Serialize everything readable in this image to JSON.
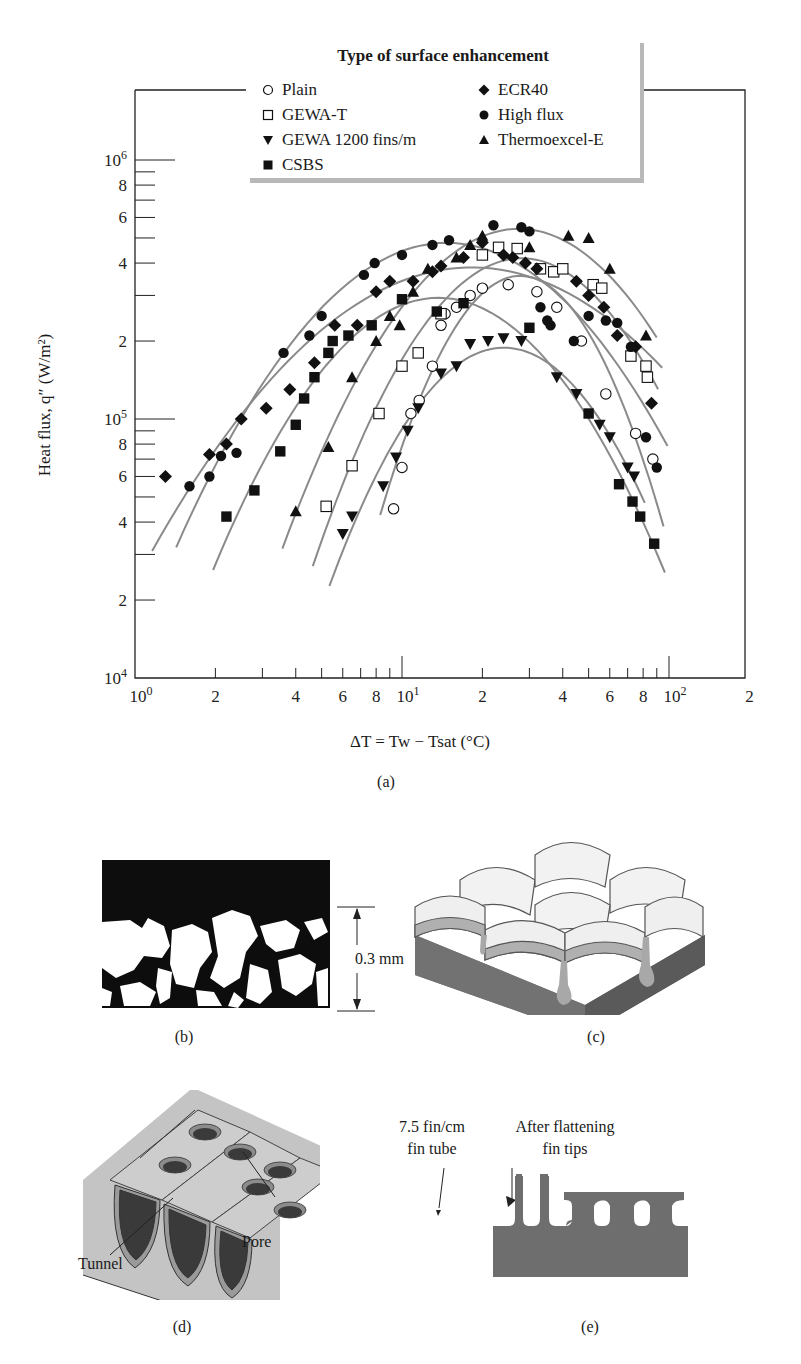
{
  "figure": {
    "panel_labels": {
      "a": "(a)",
      "b": "(b)",
      "c": "(c)",
      "d": "(d)",
      "e": "(e)"
    },
    "panel_b": {
      "scale_label": "0.3 mm"
    },
    "panel_d": {
      "tunnel_label": "Tunnel",
      "pore_label": "Pore"
    },
    "panel_e": {
      "left_label_line1": "7.5 fin/cm",
      "left_label_line2": "fin tube",
      "right_label_line1": "After flattening",
      "right_label_line2": "fin tips"
    }
  },
  "colors": {
    "curve": "#8a8a8a",
    "marker": "#111111",
    "axis": "#222222",
    "metal_dark": "#707070",
    "metal_light": "#c8c8c8"
  },
  "chart_data": {
    "type": "scatter",
    "title": "Type of surface enhancement",
    "xlabel": "ΔT = Tw − Tsat (°C)",
    "ylabel": "Heat flux, q″ (W/m²)",
    "xscale": "log",
    "yscale": "log",
    "xlim": [
      1,
      200
    ],
    "ylim": [
      10000,
      3000000
    ],
    "x_tick_labels": [
      "10^0",
      "2",
      "4",
      "6",
      "8",
      "10^1",
      "2",
      "4",
      "6",
      "8",
      "10^2",
      "2"
    ],
    "y_tick_labels": [
      "10^4",
      "2",
      "4",
      "6",
      "8",
      "10^5",
      "2",
      "4",
      "6",
      "8",
      "10^6"
    ],
    "grid": false,
    "legend_position": "top-center",
    "series": [
      {
        "name": "Plain",
        "marker": "open-circle",
        "points": [
          [
            9.3,
            45000
          ],
          [
            10,
            65000
          ],
          [
            10.8,
            105000
          ],
          [
            11.6,
            118000
          ],
          [
            13,
            160000
          ],
          [
            14,
            230000
          ],
          [
            14.5,
            255000
          ],
          [
            16,
            270000
          ],
          [
            18,
            300000
          ],
          [
            20,
            320000
          ],
          [
            25,
            330000
          ],
          [
            32,
            310000
          ],
          [
            38,
            270000
          ],
          [
            47,
            200000
          ],
          [
            58,
            125000
          ],
          [
            75,
            88000
          ],
          [
            87,
            70000
          ]
        ]
      },
      {
        "name": "GEWA-T",
        "marker": "open-square",
        "points": [
          [
            5.2,
            46000
          ],
          [
            6.5,
            66000
          ],
          [
            8.2,
            105000
          ],
          [
            10,
            160000
          ],
          [
            11.5,
            180000
          ],
          [
            14,
            255000
          ],
          [
            20,
            430000
          ],
          [
            23,
            460000
          ],
          [
            27,
            455000
          ],
          [
            33,
            380000
          ],
          [
            37,
            370000
          ],
          [
            40,
            380000
          ],
          [
            52,
            330000
          ],
          [
            56,
            320000
          ],
          [
            72,
            175000
          ],
          [
            82,
            160000
          ],
          [
            83,
            145000
          ]
        ]
      },
      {
        "name": "GEWA 1200 fins/m",
        "marker": "filled-triangle-down",
        "points": [
          [
            6,
            36000
          ],
          [
            6.5,
            42000
          ],
          [
            8.5,
            55000
          ],
          [
            9.5,
            71000
          ],
          [
            10.5,
            90000
          ],
          [
            11.5,
            110000
          ],
          [
            14,
            150000
          ],
          [
            16,
            160000
          ],
          [
            18,
            195000
          ],
          [
            21,
            200000
          ],
          [
            24,
            205000
          ],
          [
            28,
            200000
          ],
          [
            38,
            145000
          ],
          [
            45,
            125000
          ],
          [
            55,
            95000
          ],
          [
            60,
            85000
          ],
          [
            70,
            65000
          ],
          [
            74,
            60000
          ]
        ]
      },
      {
        "name": "CSBS",
        "marker": "filled-square",
        "points": [
          [
            2.2,
            42000
          ],
          [
            2.8,
            53000
          ],
          [
            3.5,
            75000
          ],
          [
            4,
            95000
          ],
          [
            4.3,
            120000
          ],
          [
            4.7,
            145000
          ],
          [
            5.3,
            180000
          ],
          [
            5.5,
            200000
          ],
          [
            6.3,
            210000
          ],
          [
            7.7,
            230000
          ],
          [
            10,
            290000
          ],
          [
            13.5,
            260000
          ],
          [
            17,
            280000
          ],
          [
            30,
            225000
          ],
          [
            50,
            105000
          ],
          [
            65,
            56000
          ],
          [
            73,
            48000
          ],
          [
            78,
            42000
          ],
          [
            88,
            33000
          ]
        ]
      },
      {
        "name": "ECR40",
        "marker": "filled-diamond",
        "points": [
          [
            1.3,
            60000
          ],
          [
            1.9,
            73000
          ],
          [
            2.2,
            80000
          ],
          [
            2.5,
            100000
          ],
          [
            3.1,
            110000
          ],
          [
            3.8,
            130000
          ],
          [
            4.7,
            165000
          ],
          [
            5.6,
            230000
          ],
          [
            6.8,
            230000
          ],
          [
            8,
            310000
          ],
          [
            9,
            340000
          ],
          [
            11,
            340000
          ],
          [
            13,
            370000
          ],
          [
            14,
            390000
          ],
          [
            17,
            420000
          ],
          [
            20,
            480000
          ],
          [
            24,
            430000
          ],
          [
            26,
            420000
          ],
          [
            29,
            400000
          ],
          [
            32,
            380000
          ],
          [
            45,
            340000
          ],
          [
            50,
            300000
          ],
          [
            57,
            270000
          ],
          [
            64,
            210000
          ],
          [
            75,
            190000
          ],
          [
            86,
            115000
          ]
        ]
      },
      {
        "name": "High flux",
        "marker": "filled-circle",
        "points": [
          [
            1.6,
            55000
          ],
          [
            1.9,
            60000
          ],
          [
            2.1,
            72000
          ],
          [
            2.4,
            74000
          ],
          [
            3.6,
            180000
          ],
          [
            4.5,
            210000
          ],
          [
            5,
            250000
          ],
          [
            7.2,
            360000
          ],
          [
            7.9,
            400000
          ],
          [
            10,
            430000
          ],
          [
            13,
            470000
          ],
          [
            15,
            490000
          ],
          [
            22,
            560000
          ],
          [
            28,
            550000
          ],
          [
            30,
            530000
          ],
          [
            33,
            270000
          ],
          [
            35,
            240000
          ],
          [
            36,
            230000
          ],
          [
            44,
            200000
          ],
          [
            50,
            250000
          ],
          [
            58,
            240000
          ],
          [
            64,
            235000
          ],
          [
            72,
            190000
          ],
          [
            82,
            85000
          ],
          [
            90,
            65000
          ]
        ]
      },
      {
        "name": "Thermoexcel-E",
        "marker": "filled-triangle-up",
        "points": [
          [
            4,
            44000
          ],
          [
            5.3,
            78000
          ],
          [
            6.5,
            145000
          ],
          [
            8,
            200000
          ],
          [
            9,
            250000
          ],
          [
            9.8,
            230000
          ],
          [
            11,
            310000
          ],
          [
            12.5,
            380000
          ],
          [
            16,
            420000
          ],
          [
            18,
            470000
          ],
          [
            20,
            510000
          ],
          [
            30,
            460000
          ],
          [
            42,
            510000
          ],
          [
            50,
            500000
          ],
          [
            60,
            380000
          ],
          [
            82,
            210000
          ]
        ]
      }
    ]
  }
}
